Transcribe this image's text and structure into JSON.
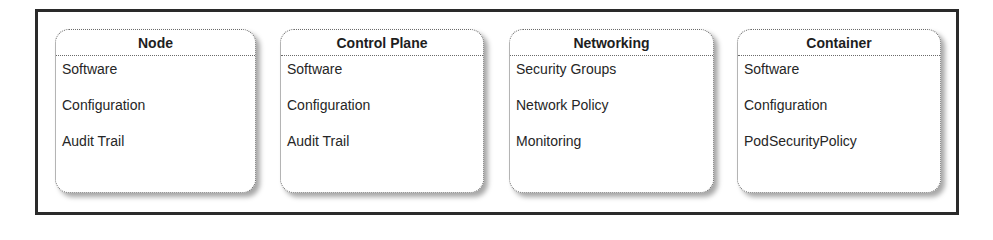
{
  "diagram": {
    "boxes": [
      {
        "title": "Node",
        "items": [
          "Software",
          "Configuration",
          "Audit Trail"
        ]
      },
      {
        "title": "Control Plane",
        "items": [
          "Software",
          "Configuration",
          "Audit Trail"
        ]
      },
      {
        "title": "Networking",
        "items": [
          "Security Groups",
          "Network Policy",
          "Monitoring"
        ]
      },
      {
        "title": "Container",
        "items": [
          "Software",
          "Configuration",
          "PodSecurityPolicy"
        ]
      }
    ]
  }
}
